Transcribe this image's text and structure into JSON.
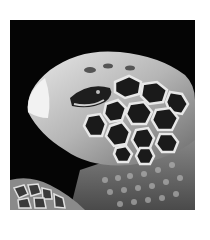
{
  "image": {
    "subject": "sea turtle head close-up",
    "style": "grayscale photograph",
    "colors": {
      "background": "#ffffff",
      "photo_background": "#050505",
      "skin_light": "#d8d8d8",
      "skin_mid": "#9a9a9a",
      "scale_dark": "#1a1a1a",
      "scale_line": "#e6e6e6"
    }
  }
}
